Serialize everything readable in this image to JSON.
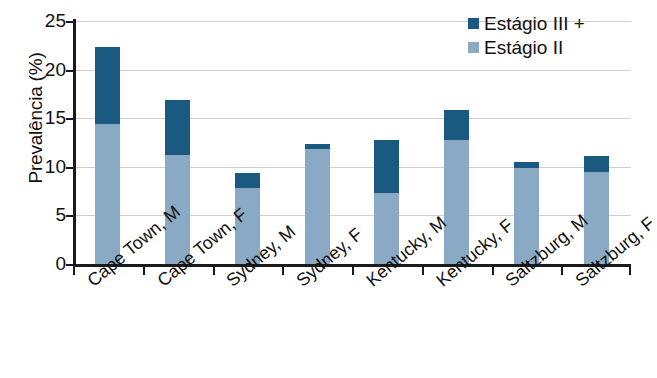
{
  "chart_data": {
    "type": "bar",
    "subtype": "stacked-bar",
    "title": "",
    "xlabel": "",
    "ylabel": "Prevalência (%)",
    "ylim": [
      0,
      25
    ],
    "yticks": [
      0,
      5,
      10,
      15,
      20,
      25
    ],
    "ytick_labels": [
      "0",
      "5",
      "10",
      "15",
      "20",
      "25"
    ],
    "grid": true,
    "grid_axis": "y",
    "legend_position": "top-right",
    "categories": [
      "Cape Town, M",
      "Cape Town, F",
      "Sydney, M",
      "Sydney, F",
      "Kentucky, M",
      "Kentucky, F",
      "Saltzburg, M",
      "Saltzburg, F"
    ],
    "series": [
      {
        "name": "Estágio II",
        "color": "#8aa9c4",
        "values": [
          14.4,
          11.2,
          7.8,
          11.8,
          7.3,
          12.8,
          9.9,
          9.5
        ]
      },
      {
        "name": "Estágio III +",
        "color": "#1a5a80",
        "values": [
          7.9,
          5.7,
          1.6,
          0.5,
          5.5,
          3.0,
          0.6,
          1.6
        ]
      }
    ],
    "totals": [
      22.3,
      16.9,
      9.4,
      12.3,
      12.8,
      15.8,
      10.5,
      11.1
    ]
  },
  "legend": {
    "items": [
      {
        "label": "Estágio III +",
        "color": "#1a5a80",
        "swatch": "legend-swatch-estagio-iii"
      },
      {
        "label": "Estágio II",
        "color": "#8aa9c4",
        "swatch": "legend-swatch-estagio-ii"
      }
    ]
  },
  "axes": {
    "y_title": "Prevalência (%)"
  },
  "colors": {
    "stage_iii_plus": "#1a5a80",
    "stage_ii": "#8aa9c4",
    "axis": "#1a1a1a",
    "gridline": "#cfcfcf",
    "background": "#ffffff"
  }
}
